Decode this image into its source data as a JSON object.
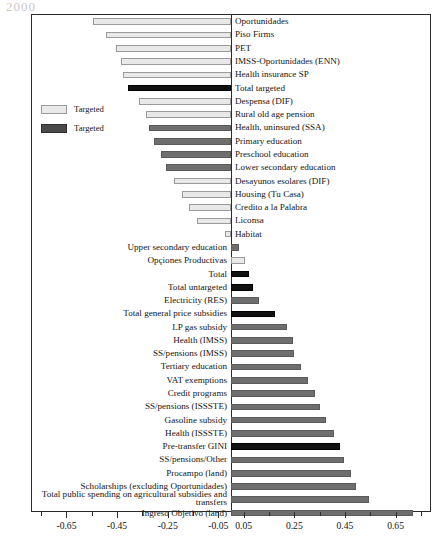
{
  "top_fragment": "2000",
  "legend": {
    "items": [
      {
        "label": "Targeted",
        "style": "light"
      },
      {
        "label": "Targeted",
        "style": "dark"
      }
    ]
  },
  "axis": {
    "tick_labels": [
      "-0.65",
      "-0.45",
      "-0.25",
      "-0.05",
      "0.05",
      "0.25",
      "0.45",
      "0.65"
    ],
    "tick_values": [
      -0.65,
      -0.45,
      -0.25,
      -0.05,
      0.05,
      0.25,
      0.45,
      0.65
    ],
    "minor_tick_values": [
      -0.75,
      -0.55,
      -0.35,
      -0.15,
      0.15,
      0.35,
      0.55,
      0.75
    ],
    "min": -0.79,
    "max": 0.79
  },
  "chart_data": {
    "type": "bar",
    "orientation": "horizontal",
    "title": "",
    "xlabel": "",
    "ylabel": "",
    "xlim": [
      -0.79,
      0.79
    ],
    "grid": false,
    "legend_position": "left-middle",
    "colors": {
      "light": "#e9e9e9",
      "mid": "#6e6e6e",
      "dark": "#111111",
      "axis": "#2b2b2b"
    },
    "categories": [
      "Oportunidades",
      "Piso Firms",
      "PET",
      "IMSS-Oportunidades (ENN)",
      "Health insurance SP",
      "Total targeted",
      "Despensa (DIF)",
      "Rural old age pension",
      "Health, uninsured (SSA)",
      "Primary education",
      "Preschool education",
      "Lower secondary education",
      "Desayunos esolares (DIF)",
      "Housing (Tu Casa)",
      "Credito a la Palabra",
      "Liconsa",
      "Habitat",
      "Upper secondary education",
      "Opçiones Productivas",
      "Total",
      "Total untargeted",
      "Electricity (RES)",
      "Total general price subsidies",
      "LP gas subsidy",
      "Health (IMSS)",
      "SS/pensions (IMSS)",
      "Tertiary education",
      "VAT exemptions",
      "Credit programs",
      "SS/pensions (ISSSTE)",
      "Gasoline subsidy",
      "Health (ISSSTE)",
      "Pre-transfer GINI",
      "SS/pensions/Other",
      "Procampo (land)",
      "Scholarships (excluding Oportunidades)",
      "Total public spending on agricultural subsidies and transfers",
      "Ingreso Objetivo (land)"
    ],
    "values": [
      -0.545,
      -0.495,
      -0.455,
      -0.435,
      -0.425,
      -0.405,
      -0.365,
      -0.335,
      -0.325,
      -0.305,
      -0.275,
      -0.255,
      -0.225,
      -0.195,
      -0.165,
      -0.135,
      -0.025,
      0.03,
      0.055,
      0.07,
      0.085,
      0.11,
      0.175,
      0.22,
      0.245,
      0.25,
      0.275,
      0.305,
      0.33,
      0.35,
      0.375,
      0.405,
      0.43,
      0.445,
      0.475,
      0.495,
      0.545,
      0.72
    ],
    "bar_styles": [
      "light",
      "light",
      "light",
      "light",
      "light",
      "dark",
      "light",
      "light",
      "mid",
      "mid",
      "mid",
      "mid",
      "light",
      "light",
      "light",
      "light",
      "light",
      "mid",
      "light",
      "dark",
      "dark",
      "mid",
      "dark",
      "mid",
      "mid",
      "mid",
      "mid",
      "mid",
      "mid",
      "mid",
      "mid",
      "mid",
      "dark",
      "mid",
      "mid",
      "mid",
      "mid",
      "mid"
    ],
    "label_sides": [
      "right",
      "right",
      "right",
      "right",
      "right",
      "right",
      "right",
      "right",
      "right",
      "right",
      "right",
      "right",
      "right",
      "right",
      "right",
      "right",
      "right",
      "left",
      "left",
      "left",
      "left",
      "left",
      "left",
      "left",
      "left",
      "left",
      "left",
      "left",
      "left",
      "left",
      "left",
      "left",
      "left",
      "left",
      "left",
      "left",
      "left",
      "left"
    ]
  }
}
